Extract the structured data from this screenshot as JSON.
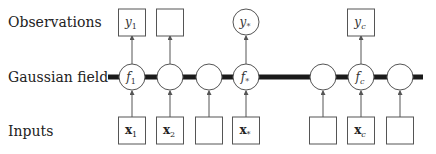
{
  "rows": {
    "observations": "Observations",
    "gaussian_field": "Gaussian field",
    "inputs": "Inputs"
  },
  "field_nodes": [
    {
      "x": 132,
      "label": "f",
      "sub": "1",
      "sub_italic": false
    },
    {
      "x": 170,
      "label": "",
      "sub": ""
    },
    {
      "x": 209,
      "label": "",
      "sub": ""
    },
    {
      "x": 246,
      "label": "f",
      "sub": "*",
      "sub_italic": false
    },
    {
      "x": 323,
      "label": "",
      "sub": ""
    },
    {
      "x": 361,
      "label": "f",
      "sub": "c",
      "sub_italic": true
    },
    {
      "x": 400,
      "label": "",
      "sub": ""
    }
  ],
  "observation_nodes": [
    {
      "x": 132,
      "shape": "box",
      "label": "y",
      "sub": "1"
    },
    {
      "x": 170,
      "shape": "box",
      "label": "",
      "sub": ""
    },
    {
      "x": 246,
      "shape": "circle",
      "label": "y",
      "sub": "*"
    },
    {
      "x": 361,
      "shape": "box",
      "label": "y",
      "sub": "c"
    }
  ],
  "input_nodes": [
    {
      "x": 132,
      "label": "x",
      "sub": "1"
    },
    {
      "x": 170,
      "label": "x",
      "sub": "2"
    },
    {
      "x": 209,
      "label": "",
      "sub": ""
    },
    {
      "x": 246,
      "label": "x",
      "sub": "*"
    },
    {
      "x": 323,
      "label": "",
      "sub": ""
    },
    {
      "x": 361,
      "label": "x",
      "sub": "c"
    },
    {
      "x": 400,
      "label": "",
      "sub": ""
    }
  ],
  "colors": {
    "stroke": "#555555",
    "field_line": "#1a1a1a",
    "text": "#222222"
  }
}
